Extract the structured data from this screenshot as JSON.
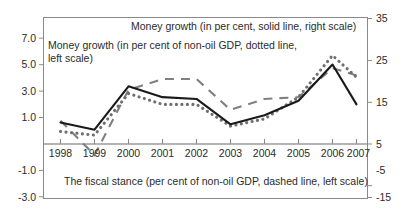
{
  "chart_data": {
    "type": "line",
    "title": "",
    "subtitle": "",
    "xlabel": "",
    "ylabel": "",
    "grid": false,
    "legend_position": "inline-annotations",
    "categories": [
      "1998",
      "1999",
      "2000",
      "2001",
      "2002",
      "2003",
      "2004",
      "2005",
      "2006",
      "2007"
    ],
    "x_tick_labels": [
      "1998",
      "1999",
      "2000",
      "2001",
      "2002",
      "2003",
      "2004",
      "2005",
      "2006",
      "2007"
    ],
    "left_axis": {
      "label": "per cent of non-oil GDP",
      "ylim": [
        -3.0,
        7.0
      ],
      "tick_labels": [
        "7.0",
        "5.0",
        "3.0",
        "1.0",
        "-1.0",
        "-3.0"
      ],
      "tick_values": [
        7.0,
        5.0,
        3.0,
        1.0,
        -1.0,
        -3.0
      ]
    },
    "right_axis": {
      "label": "per cent",
      "ylim": [
        -15,
        35
      ],
      "tick_labels": [
        "35",
        "25",
        "15",
        "5",
        "-5",
        "-15"
      ],
      "tick_values": [
        35,
        25,
        15,
        5,
        -5,
        -15
      ]
    },
    "series": [
      {
        "name": "Money growth (in per cent, solid line, right scale)",
        "style": "solid",
        "axis": "right",
        "color": "#1a1a1a",
        "values": [
          6.0,
          4.0,
          16.0,
          13.0,
          12.5,
          5.5,
          8.0,
          12.0,
          22.0,
          11.0
        ]
      },
      {
        "name": "Money growth (in per cent of non-oil GDP, dotted line, left scale)",
        "style": "dotted",
        "axis": "left",
        "color": "#6e6e6e",
        "values": [
          0.7,
          0.5,
          2.8,
          2.2,
          2.2,
          1.0,
          1.4,
          2.6,
          4.9,
          3.7
        ]
      },
      {
        "name": "The fiscal stance (per cent of non-oil GDP, dashed line, left scale)",
        "style": "dashed",
        "axis": "left",
        "color": "#808080",
        "values": [
          1.3,
          -0.6,
          3.0,
          3.6,
          3.6,
          1.9,
          2.5,
          2.6,
          4.2,
          3.8
        ]
      }
    ],
    "annotations": [
      {
        "id": "solid-series-note",
        "text": "Money growth (in per cent, solid line, right scale)"
      },
      {
        "id": "dotted-series-note-line1",
        "text": "Money growth (in per cent of non-oil GDP, dotted line,"
      },
      {
        "id": "dotted-series-note-line2",
        "text": "left scale)"
      },
      {
        "id": "dashed-series-note",
        "text": "The fiscal stance (per cent of non-oil GDP, dashed line, left scale)"
      }
    ],
    "colors": {
      "solid_line": "#1a1a1a",
      "dotted_line": "#6e6e6e",
      "dashed_line": "#808080",
      "frame": "#8a8a8a",
      "zero_line": "#6b6b6b",
      "text": "#2b2b2b",
      "background": "#ffffff"
    }
  }
}
